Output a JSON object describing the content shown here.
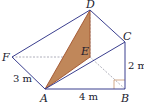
{
  "diagram": {
    "type": "3d-prism-geometry",
    "colors": {
      "edge": "#3b3f8f",
      "shaded_fill": "#c0875a",
      "shaded_edge": "#a0522d",
      "right_angle": "#c0875a",
      "hidden": "#9a9aa8"
    },
    "points": {
      "A": {
        "label": "A",
        "x": 45,
        "y": 89
      },
      "B": {
        "label": "B",
        "x": 125,
        "y": 89
      },
      "C": {
        "label": "C",
        "x": 125,
        "y": 42
      },
      "D": {
        "label": "D",
        "x": 90,
        "y": 10
      },
      "E": {
        "label": "E",
        "x": 90,
        "y": 57
      },
      "F": {
        "label": "F",
        "x": 12,
        "y": 57
      }
    },
    "measurements": {
      "AF": "3 m",
      "AB": "4 m",
      "BC": "2 m"
    }
  }
}
